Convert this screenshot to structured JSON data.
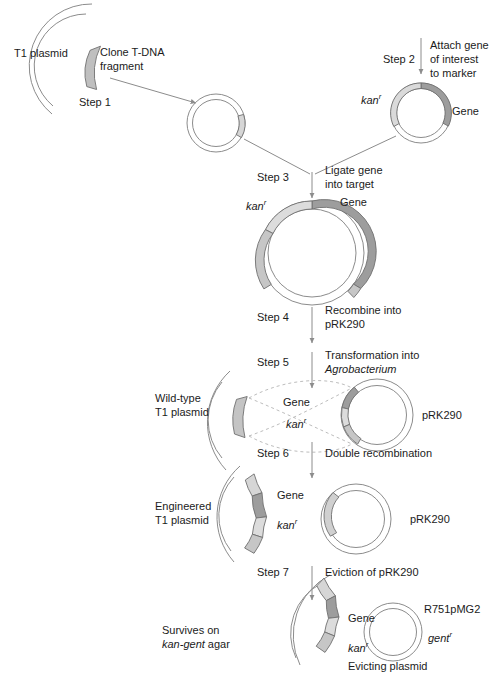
{
  "figure": {
    "type": "process-flow-diagram"
  },
  "colors": {
    "outline": "#8c8c8c",
    "text": "#1b1b1b",
    "arc_light": "#d8d8d8",
    "arc_medium": "#bcbcbc",
    "arc_dark": "#9a9a9a",
    "arc_darkest": "#8a8a8a",
    "dashed": "#b4b4b4",
    "background": "#ffffff"
  },
  "steps": [
    {
      "id": "step1",
      "number": "Step 1",
      "action_line1": "Clone T-DNA",
      "action_line2": "fragment"
    },
    {
      "id": "step2",
      "number": "Step 2",
      "action_line1": "Attach gene",
      "action_line2": "of interest",
      "action_line3": "to marker"
    },
    {
      "id": "step3",
      "number": "Step 3",
      "action_line1": "Ligate gene",
      "action_line2": "into target"
    },
    {
      "id": "step4",
      "number": "Step 4",
      "action_line1": "Recombine into",
      "action_line2": "pRK290"
    },
    {
      "id": "step5",
      "number": "Step 5",
      "action_line1": "Transformation into",
      "action_line2": "Agrobacterium",
      "action_line2_italic": true
    },
    {
      "id": "step6",
      "number": "Step 6",
      "action_line1": "Double recombination"
    },
    {
      "id": "step7",
      "number": "Step 7",
      "action_line1": "Eviction of pRK290"
    }
  ],
  "labels": {
    "t1_plasmid": "T1 plasmid",
    "kan_marker": "kan",
    "kan_superscript": "r",
    "gene": "Gene",
    "gent_marker": "gent",
    "gent_superscript": "r",
    "prk290": "pRK290",
    "prk290_after": "pRK290",
    "prk290_recombined": "pRK290",
    "wild_type_line1": "Wild-type",
    "wild_type_line2": "T1 plasmid",
    "engineered_line1": "Engineered",
    "engineered_line2": "T1 plasmid",
    "survives_line1": "Survives on",
    "survives_line2_italic": "kan-gent",
    "survives_line2_rest": " agar",
    "r751pmg2": "R751pMG2",
    "evicting_plasmid": "Evicting plasmid"
  },
  "plasmids": [
    {
      "name": "t1-plasmid-source",
      "label": "T1 plasmid",
      "shape": "arc-open-left",
      "segments": [
        "t-dna-fragment"
      ]
    },
    {
      "name": "cloned-fragment-plasmid",
      "label": "",
      "shape": "circle",
      "segments": [
        "t-dna-fragment"
      ]
    },
    {
      "name": "gene-marker-plasmid",
      "label": "",
      "shape": "circle",
      "segments": [
        "kan-marker",
        "gene"
      ]
    },
    {
      "name": "ligated-target-plasmid",
      "label": "",
      "shape": "circle",
      "segments": [
        "kan-marker",
        "gene",
        "t-dna-left",
        "t-dna-right"
      ]
    },
    {
      "name": "wild-type-t1-plasmid",
      "label": "Wild-type T1 plasmid",
      "shape": "arc-open-left",
      "segments": [
        "t-dna-fragment"
      ]
    },
    {
      "name": "prk290-recombinant-plasmid",
      "label": "pRK290",
      "shape": "circle",
      "segments": [
        "gene",
        "kan-marker",
        "t-dna-left",
        "t-dna-right"
      ]
    },
    {
      "name": "engineered-t1-plasmid",
      "label": "Engineered T1 plasmid",
      "shape": "arc-open-left",
      "segments": [
        "t-dna-left",
        "gene",
        "kan-marker",
        "t-dna-right"
      ]
    },
    {
      "name": "prk290-empty-plasmid",
      "label": "pRK290",
      "shape": "circle",
      "segments": [
        "t-dna-remnant"
      ]
    },
    {
      "name": "final-engineered-t1-plasmid",
      "label": "Survives on kan-gent agar",
      "shape": "arc-open-left",
      "segments": [
        "t-dna-left",
        "gene",
        "kan-marker",
        "t-dna-right"
      ]
    },
    {
      "name": "r751pmg2-evicting-plasmid",
      "label": "R751pMG2",
      "shape": "circle",
      "segments": []
    }
  ]
}
